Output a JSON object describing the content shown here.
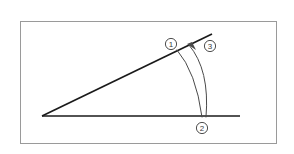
{
  "figure": {
    "background_color": "#ffffff",
    "frame": {
      "name": "diagram-frame",
      "x": 20,
      "y": 21,
      "width": 256,
      "height": 122,
      "stroke_color": "#9a9a9a",
      "stroke_width": 1
    },
    "line_color": "#1a1a1a",
    "arc_color": "#4a4a4a",
    "label_color": "#3a3a3a",
    "vertex": {
      "x": 42,
      "y": 116
    },
    "rays": [
      {
        "name": "horizontal-ray",
        "from_x": 42,
        "from_y": 116,
        "to_x": 240,
        "to_y": 116,
        "stroke_width": 1.7
      },
      {
        "name": "slanted-ray",
        "from_x": 42,
        "from_y": 116,
        "to_x": 212,
        "to_y": 34,
        "stroke_width": 1.7
      }
    ],
    "arcs": [
      {
        "name": "inner-arc",
        "start_x": 202,
        "start_y": 117,
        "control_x": 196,
        "control_y": 72,
        "end_x": 177,
        "end_y": 50,
        "stroke_width": 1.0,
        "has_arrowhead": false
      },
      {
        "name": "outer-arc",
        "start_x": 206,
        "start_y": 117,
        "control_x": 210,
        "control_y": 70,
        "end_x": 189,
        "end_y": 45,
        "stroke_width": 1.0,
        "has_arrowhead": true
      }
    ],
    "arrowhead": {
      "name": "arc-arrowhead",
      "tip_x": 187,
      "tip_y": 44,
      "points": "187,44 196,50 192,42"
    },
    "labels": [
      {
        "name": "label-marker-1",
        "text": "1",
        "cx": 171,
        "cy": 44,
        "r": 5.6
      },
      {
        "name": "label-marker-3",
        "text": "3",
        "cx": 210,
        "cy": 46,
        "r": 5.6
      },
      {
        "name": "label-marker-2",
        "text": "2",
        "cx": 202,
        "cy": 128,
        "r": 5.6
      }
    ]
  }
}
